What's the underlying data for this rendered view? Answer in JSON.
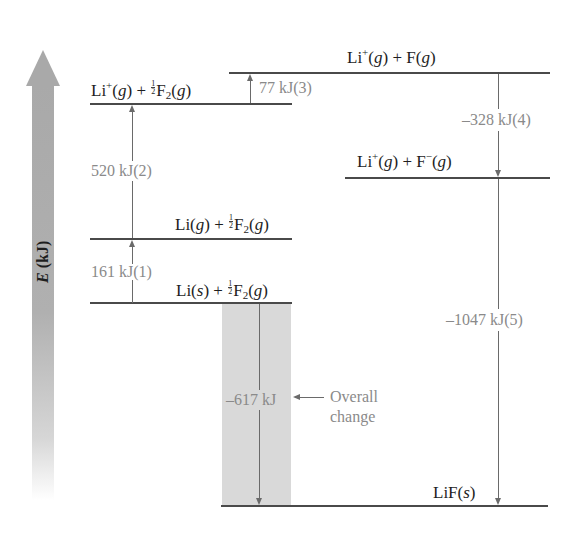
{
  "diagram": {
    "type": "energy-level diagram (Born-Haber cycle for LiF)",
    "axis": {
      "label_var": "E",
      "label_unit": " (kJ)",
      "direction": "up"
    },
    "levels": [
      {
        "id": "li-s-f2",
        "species": "Li(s) + ½F2(g)"
      },
      {
        "id": "li-g-f2",
        "species": "Li(g) + ½F2(g)"
      },
      {
        "id": "li-plus-f2",
        "species": "Li+(g) + ½F2(g)"
      },
      {
        "id": "li-plus-f",
        "species": "Li+(g) + F(g)"
      },
      {
        "id": "li-plus-f-minus",
        "species": "Li+(g) + F−(g)"
      },
      {
        "id": "lif-s",
        "species": "LiF(s)"
      }
    ],
    "steps": [
      {
        "label": "161 kJ(1)",
        "from": "li-s-f2",
        "to": "li-g-f2",
        "direction": "up"
      },
      {
        "label": "520 kJ(2)",
        "from": "li-g-f2",
        "to": "li-plus-f2",
        "direction": "up"
      },
      {
        "label": "77 kJ(3)",
        "from": "li-plus-f2",
        "to": "li-plus-f",
        "direction": "up"
      },
      {
        "label": "–328 kJ(4)",
        "from": "li-plus-f",
        "to": "li-plus-f-minus",
        "direction": "down"
      },
      {
        "label": "–1047 kJ(5)",
        "from": "li-plus-f-minus",
        "to": "lif-s",
        "direction": "down"
      }
    ],
    "overall": {
      "label": "–617 kJ",
      "note_line1": "Overall",
      "note_line2": "change"
    }
  },
  "text": {
    "li": "Li",
    "plus": "+",
    "minus": "−",
    "g": "g",
    "s": "s",
    "half_n": "1",
    "half_d": "2",
    "f": "F",
    "two": "2",
    "lif": "LiF"
  }
}
